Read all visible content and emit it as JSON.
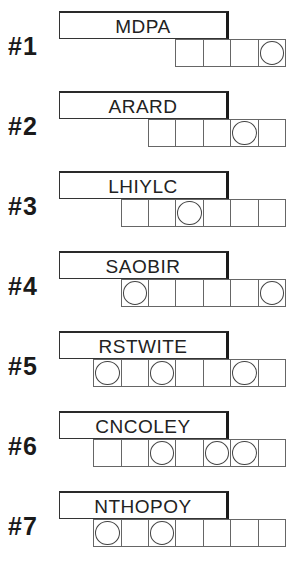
{
  "puzzles": [
    {
      "label": "#1",
      "scrambled": "MDPA",
      "length": 4,
      "circled": [
        3
      ]
    },
    {
      "label": "#2",
      "scrambled": "ARARD",
      "length": 5,
      "circled": [
        3
      ]
    },
    {
      "label": "#3",
      "scrambled": "LHIYLC",
      "length": 6,
      "circled": [
        2
      ]
    },
    {
      "label": "#4",
      "scrambled": "SAOBIR",
      "length": 6,
      "circled": [
        0,
        5
      ]
    },
    {
      "label": "#5",
      "scrambled": "RSTWITE",
      "length": 7,
      "circled": [
        0,
        2,
        5
      ]
    },
    {
      "label": "#6",
      "scrambled": "CNCOLEY",
      "length": 7,
      "circled": [
        2,
        4,
        5
      ]
    },
    {
      "label": "#7",
      "scrambled": "NTHOPOY",
      "length": 7,
      "circled": [
        0,
        2
      ]
    }
  ],
  "colors": {
    "ink": "#1a1a1a",
    "background": "#ffffff"
  }
}
